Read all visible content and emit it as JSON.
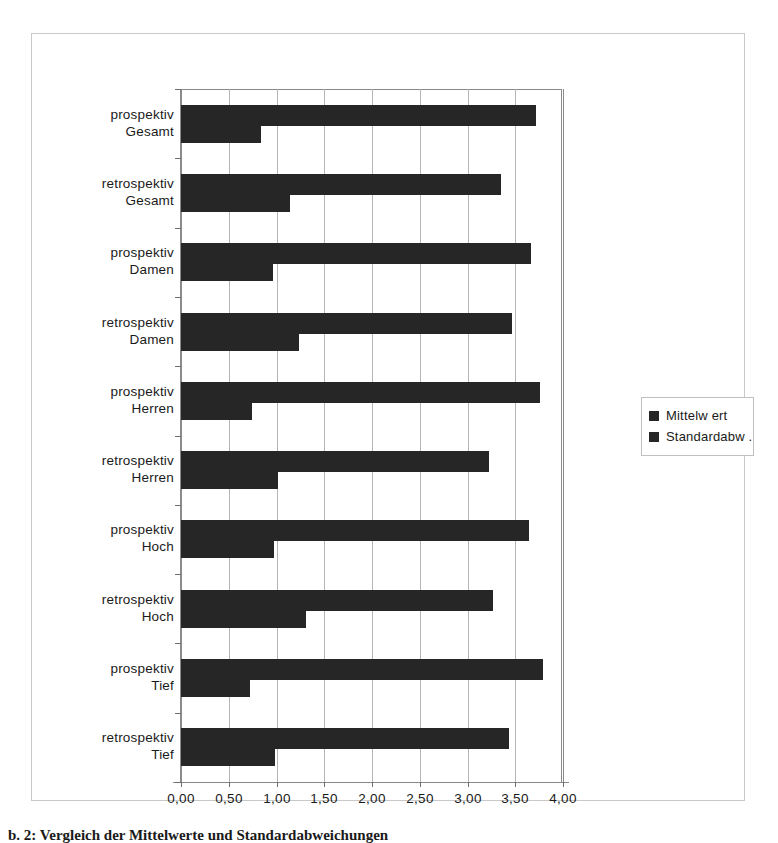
{
  "legend": {
    "items": [
      {
        "label": "Mittelw ert",
        "color": "#262626"
      },
      {
        "label": "Standardabw .",
        "color": "#262626"
      }
    ]
  },
  "axis": {
    "x_ticks": [
      "0,00",
      "0,50",
      "1,00",
      "1,50",
      "2,00",
      "2,50",
      "3,00",
      "3,50",
      "4,00"
    ]
  },
  "caption": {
    "text": "b. 2: Vergleich der Mittelwerte und Standardabweichungen"
  },
  "chart_data": {
    "type": "bar",
    "orientation": "horizontal",
    "title": "",
    "xlabel": "",
    "ylabel": "",
    "xlim": [
      0,
      4
    ],
    "xticks": [
      0,
      0.5,
      1,
      1.5,
      2,
      2.5,
      3,
      3.5,
      4
    ],
    "xtick_labels": [
      "0,00",
      "0,50",
      "1,00",
      "1,50",
      "2,00",
      "2,50",
      "3,00",
      "3,50",
      "4,00"
    ],
    "grid": "vertical",
    "legend_position": "right",
    "categories": [
      "prospektiv Gesamt",
      "retrospektiv Gesamt",
      "prospektiv Damen",
      "retrospektiv Damen",
      "prospektiv Herren",
      "retrospektiv Herren",
      "prospektiv Hoch",
      "retrospektiv Hoch",
      "prospektiv Tief",
      "retrospektiv Tief"
    ],
    "category_lines": [
      [
        "prospektiv",
        "Gesamt"
      ],
      [
        "retrospektiv",
        "Gesamt"
      ],
      [
        "prospektiv",
        "Damen"
      ],
      [
        "retrospektiv",
        "Damen"
      ],
      [
        "prospektiv",
        "Herren"
      ],
      [
        "retrospektiv",
        "Herren"
      ],
      [
        "prospektiv",
        "Hoch"
      ],
      [
        "retrospektiv",
        "Hoch"
      ],
      [
        "prospektiv",
        "Tief"
      ],
      [
        "retrospektiv",
        "Tief"
      ]
    ],
    "series": [
      {
        "name": "Mittelw ert",
        "color": "#262626",
        "values": [
          3.72,
          3.35,
          3.67,
          3.47,
          3.76,
          3.23,
          3.64,
          3.27,
          3.79,
          3.43
        ]
      },
      {
        "name": "Standardabw .",
        "color": "#262626",
        "values": [
          0.84,
          1.14,
          0.96,
          1.24,
          0.74,
          1.02,
          0.97,
          1.31,
          0.72,
          0.98
        ]
      }
    ]
  }
}
